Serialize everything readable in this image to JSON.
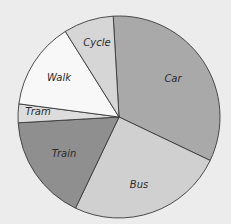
{
  "chart_data": {
    "type": "pie",
    "title": "",
    "start_angle_deg": -3.3,
    "direction": "clockwise",
    "center": [
      119,
      117
    ],
    "radius": 101,
    "slices": [
      {
        "label": "Car",
        "value": 33,
        "color": "#a9a9a9",
        "label_pos": [
          173,
          79
        ]
      },
      {
        "label": "Bus",
        "value": 25,
        "color": "#d0d0d0",
        "label_pos": [
          139,
          185
        ]
      },
      {
        "label": "Train",
        "value": 17,
        "color": "#8f8f8f",
        "label_pos": [
          64,
          154
        ]
      },
      {
        "label": "Tram",
        "value": 3,
        "color": "#dddddd",
        "label_pos": [
          38,
          112
        ]
      },
      {
        "label": "Walk",
        "value": 14,
        "color": "#f8f8f8",
        "label_pos": [
          59,
          78
        ]
      },
      {
        "label": "Cycle",
        "value": 8,
        "color": "#d6d6d6",
        "label_pos": [
          97,
          43
        ]
      }
    ],
    "legend": "none",
    "grid": false
  }
}
